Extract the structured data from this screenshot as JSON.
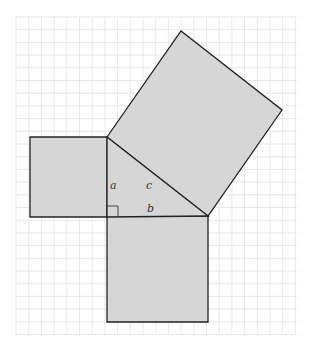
{
  "diagram": {
    "labels": {
      "a": "a",
      "b": "b",
      "c": "c"
    },
    "colors": {
      "fill": "#d6d6d6",
      "stroke": "#222222",
      "grid": "#e2e2e2",
      "background": "#ffffff"
    },
    "grid": {
      "x0": 16,
      "y0": 17,
      "x1": 297,
      "y1": 335,
      "spacing": 12.7
    },
    "triangle": {
      "right_angle": [
        107,
        217
      ],
      "top": [
        107,
        137
      ],
      "right": [
        208,
        216
      ]
    },
    "squares": {
      "a_square": [
        [
          30,
          137
        ],
        [
          107,
          137
        ],
        [
          107,
          217
        ],
        [
          30,
          217
        ]
      ],
      "b_square": [
        [
          107,
          216
        ],
        [
          208,
          216
        ],
        [
          208,
          322
        ],
        [
          107,
          322
        ]
      ],
      "c_square": [
        [
          107,
          137
        ],
        [
          181,
          31
        ],
        [
          282,
          110
        ],
        [
          208,
          216
        ]
      ]
    }
  }
}
